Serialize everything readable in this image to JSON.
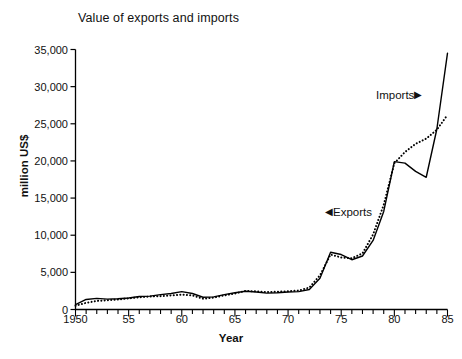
{
  "chart_data": {
    "type": "line",
    "title": "Value of exports and imports",
    "xlabel": "Year",
    "ylabel": "million US$",
    "xlim": [
      1950,
      1985
    ],
    "ylim": [
      0,
      35000
    ],
    "ytick_values": [
      0,
      5000,
      10000,
      15000,
      20000,
      25000,
      30000,
      35000
    ],
    "ytick_labels": [
      "0",
      "5,000",
      "10,000",
      "15,000",
      "20,000",
      "25,000",
      "30,000",
      "35,000"
    ],
    "xtick_values": [
      1950,
      1955,
      1960,
      1965,
      1970,
      1975,
      1980,
      1985
    ],
    "xtick_labels": [
      "1950",
      "55",
      "60",
      "65",
      "70",
      "75",
      "80",
      "85"
    ],
    "xtick_minor_step": 1,
    "grid": false,
    "legend_position": "inline-annotations",
    "x": [
      1950,
      1951,
      1952,
      1953,
      1954,
      1955,
      1956,
      1957,
      1958,
      1959,
      1960,
      1961,
      1962,
      1963,
      1964,
      1965,
      1966,
      1967,
      1968,
      1969,
      1970,
      1971,
      1972,
      1973,
      1974,
      1975,
      1976,
      1977,
      1978,
      1979,
      1980,
      1981,
      1982,
      1983,
      1984,
      1985
    ],
    "series": [
      {
        "name": "Imports",
        "style": "solid",
        "color": "#000000",
        "label_text": "Imports",
        "label_arrow": "right-triangle",
        "values": [
          650,
          1350,
          1500,
          1400,
          1450,
          1550,
          1750,
          1800,
          2000,
          2150,
          2400,
          2150,
          1650,
          1700,
          2000,
          2250,
          2450,
          2350,
          2200,
          2250,
          2350,
          2400,
          2700,
          4200,
          7700,
          7400,
          6700,
          7200,
          9300,
          13200,
          19900,
          19700,
          18600,
          17800,
          24300,
          34500
        ]
      },
      {
        "name": "Exports",
        "style": "dotted",
        "color": "#000000",
        "label_text": "Exports",
        "label_arrow": "left-triangle",
        "values": [
          500,
          900,
          1150,
          1250,
          1350,
          1500,
          1650,
          1750,
          1800,
          1900,
          2000,
          1900,
          1450,
          1600,
          1900,
          2150,
          2500,
          2450,
          2350,
          2400,
          2450,
          2550,
          2950,
          4600,
          7400,
          7000,
          6900,
          7550,
          10100,
          14100,
          19700,
          21200,
          22300,
          23000,
          24200,
          26200
        ]
      }
    ]
  }
}
